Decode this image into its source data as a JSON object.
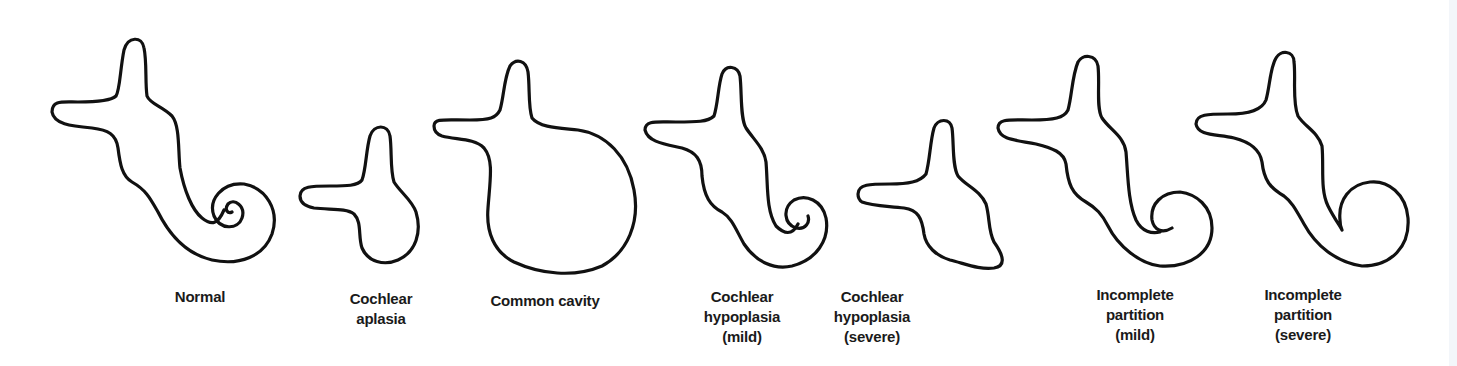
{
  "figure": {
    "stroke_color": "#111111",
    "background": "#ffffff",
    "panels": [
      {
        "id": "normal",
        "label_lines": [
          "Normal"
        ],
        "label_x": 200,
        "label_y": 287
      },
      {
        "id": "cochlear-aplasia",
        "label_lines": [
          "Cochlear",
          "aplasia"
        ],
        "label_x": 381,
        "label_y": 289
      },
      {
        "id": "common-cavity",
        "label_lines": [
          "Common cavity"
        ],
        "label_x": 545,
        "label_y": 291
      },
      {
        "id": "cochlear-hypoplasia-mild",
        "label_lines": [
          "Cochlear",
          "hypoplasia",
          "(mild)"
        ],
        "label_x": 742,
        "label_y": 287
      },
      {
        "id": "cochlear-hypoplasia-severe",
        "label_lines": [
          "Cochlear",
          "hypoplasia",
          "(severe)"
        ],
        "label_x": 872,
        "label_y": 287
      },
      {
        "id": "incomplete-partition-mild",
        "label_lines": [
          "Incomplete",
          "partition",
          "(mild)"
        ],
        "label_x": 1135,
        "label_y": 285
      },
      {
        "id": "incomplete-partition-severe",
        "label_lines": [
          "Incomplete",
          "partition",
          "(severe)"
        ],
        "label_x": 1303,
        "label_y": 285
      }
    ]
  }
}
